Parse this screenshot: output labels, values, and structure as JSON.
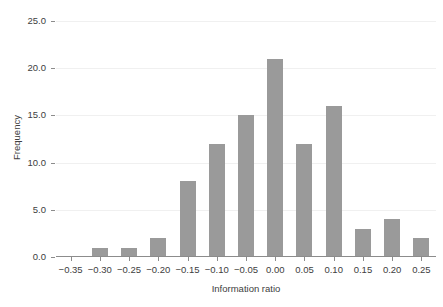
{
  "chart_data": {
    "type": "bar",
    "title": "",
    "xlabel": "Information ratio",
    "ylabel": "Frequency",
    "categories": [
      "-0.35",
      "-0.30",
      "-0.25",
      "-0.20",
      "-0.15",
      "-0.10",
      "-0.05",
      "0.00",
      "0.05",
      "0.10",
      "0.15",
      "0.20",
      "0.25"
    ],
    "values": [
      0,
      1,
      1,
      2,
      8,
      12,
      15,
      21,
      12,
      16,
      3,
      4,
      2
    ],
    "xticklabels": [
      "−0.35",
      "−0.30",
      "−0.25",
      "−0.20",
      "−0.15",
      "−0.10",
      "−0.05",
      "0.00",
      "0.05",
      "0.10",
      "0.15",
      "0.20",
      "0.25"
    ],
    "yticklabels": [
      "0.0",
      "5.0",
      "10.0",
      "15.0",
      "20.0",
      "25.0"
    ],
    "ytickvalues": [
      0,
      5,
      10,
      15,
      20,
      25
    ],
    "ylim": [
      0,
      25
    ],
    "grid": true,
    "legend": null,
    "bar_color": "#9a9a9a",
    "gridline_color": "#f0f0f0",
    "axis_color": "#8c8c8c",
    "text_color": "#404040"
  },
  "figure": {
    "title_cut_off": ""
  }
}
